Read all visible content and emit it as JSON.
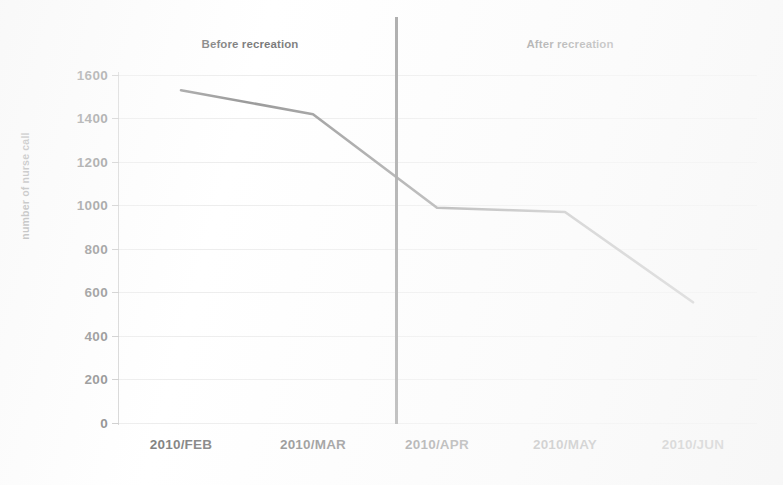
{
  "chart_data": {
    "type": "line",
    "title": "",
    "subtitle": "",
    "xlabel": "",
    "ylabel": "number of nurse call",
    "categories": [
      "2010/FEB",
      "2010/MAR",
      "2010/APR",
      "2010/MAY",
      "2010/JUN"
    ],
    "series": [
      {
        "name": "number of nurse call",
        "values": [
          1530,
          1420,
          990,
          970,
          555
        ],
        "color": "#4a4a4a"
      }
    ],
    "ylim": [
      0,
      1600
    ],
    "yticks": [
      0,
      200,
      400,
      600,
      800,
      1000,
      1200,
      1400,
      1600
    ],
    "ytick_labels": [
      "0",
      "200",
      "400",
      "600",
      "800",
      "1000",
      "1200",
      "1400",
      "1600"
    ],
    "grid": true,
    "grid_color": "#dcdcdc",
    "legend": false,
    "legend_position": "none",
    "annotations": [
      {
        "id": "before",
        "text": "Before recreation",
        "x_center_px": 250,
        "y_px": 45
      },
      {
        "id": "after",
        "text": "After recreation",
        "x_center_px": 570,
        "y_px": 45
      },
      {
        "id": "divider",
        "text": "",
        "type": "vertical-line",
        "between": [
          "2010/MAR",
          "2010/APR"
        ],
        "color": "#565656"
      }
    ],
    "axis_color": "#b9b9b9",
    "text_color": "#2e2e2e",
    "background": "#ffffff"
  },
  "axis": {
    "y_title": "number of nurse call"
  },
  "phases": {
    "before": "Before recreation",
    "after": "After recreation"
  }
}
